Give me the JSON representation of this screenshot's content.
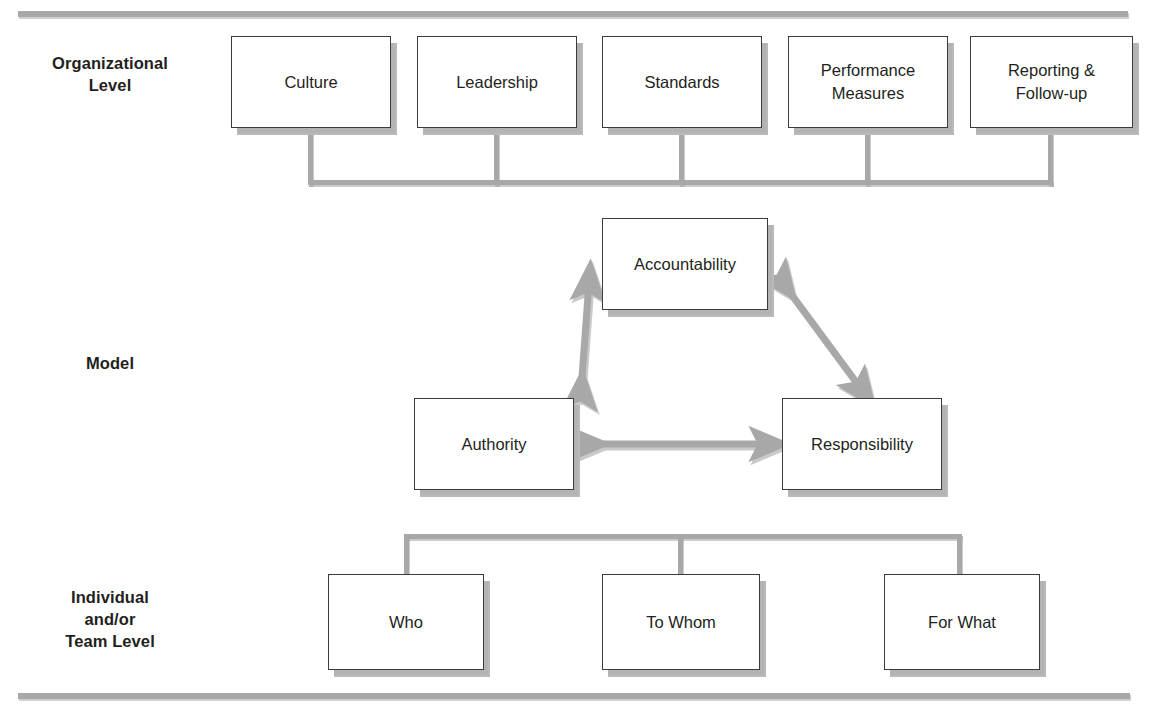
{
  "diagram": {
    "background_color": "#ffffff",
    "rule_color": "#a8a8a8",
    "box_border_color": "#3b3b3b",
    "box_fill_color": "#ffffff",
    "shadow_color": "#b9b9b9",
    "arrow_color": "#a8a8a8",
    "text_color": "#231f20"
  },
  "row_labels": {
    "organizational": "Organizational\nLevel",
    "model": "Model",
    "individual": "Individual\nand/or\nTeam Level"
  },
  "organizational_level": {
    "nodes": [
      {
        "id": "culture",
        "label": "Culture"
      },
      {
        "id": "leadership",
        "label": "Leadership"
      },
      {
        "id": "standards",
        "label": "Standards"
      },
      {
        "id": "performance",
        "label": "Performance\nMeasures"
      },
      {
        "id": "reporting",
        "label": "Reporting &\nFollow-up"
      }
    ]
  },
  "model_level": {
    "nodes": [
      {
        "id": "accountability",
        "label": "Accountability"
      },
      {
        "id": "authority",
        "label": "Authority"
      },
      {
        "id": "responsibility",
        "label": "Responsibility"
      }
    ],
    "connections": [
      {
        "from": "accountability",
        "to": "authority",
        "type": "double-arrow"
      },
      {
        "from": "accountability",
        "to": "responsibility",
        "type": "double-arrow"
      },
      {
        "from": "authority",
        "to": "responsibility",
        "type": "double-arrow"
      }
    ]
  },
  "individual_team_level": {
    "nodes": [
      {
        "id": "who",
        "label": "Who"
      },
      {
        "id": "towhom",
        "label": "To Whom"
      },
      {
        "id": "forwhat",
        "label": "For What"
      }
    ]
  }
}
